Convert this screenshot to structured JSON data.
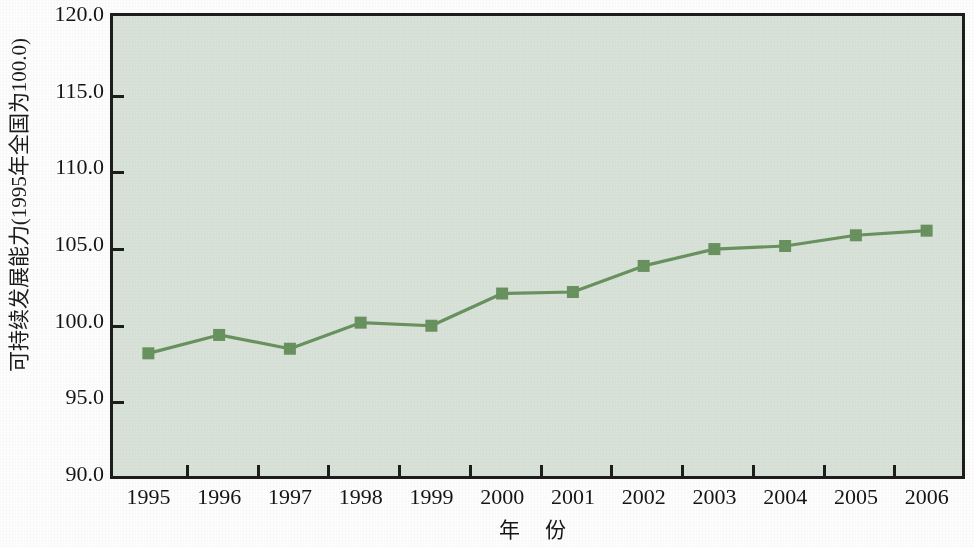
{
  "chart_data": {
    "type": "line",
    "title": "",
    "subtitle": "",
    "xlabel": "年  份",
    "ylabel": "可持续发展能力(1995年全国为100.0)",
    "categories": [
      "1995",
      "1996",
      "1997",
      "1998",
      "1999",
      "2000",
      "2001",
      "2002",
      "2003",
      "2004",
      "2005",
      "2006"
    ],
    "values": [
      98.0,
      99.2,
      98.3,
      100.0,
      99.8,
      101.9,
      102.0,
      103.7,
      104.8,
      105.0,
      105.7,
      106.0
    ],
    "series": [
      {
        "name": "可持续发展能力",
        "values": [
          98.0,
          99.2,
          98.3,
          100.0,
          99.8,
          101.9,
          102.0,
          103.7,
          104.8,
          105.0,
          105.7,
          106.0
        ]
      }
    ],
    "ylim": [
      90.0,
      120.0
    ],
    "yticks": [
      90.0,
      95.0,
      100.0,
      105.0,
      110.0,
      115.0,
      120.0
    ],
    "ytick_labels": [
      "90.0",
      "95.0",
      "100.0",
      "105.0",
      "110.0",
      "115.0",
      "120.0"
    ],
    "xtick_labels": [
      "1995",
      "1996",
      "1997",
      "1998",
      "1999",
      "2000",
      "2001",
      "2002",
      "2003",
      "2004",
      "2005",
      "2006"
    ],
    "grid": false,
    "legend": false,
    "legend_position": "none",
    "marker": "square",
    "colors": {
      "line": "#68925f",
      "marker": "#68925f",
      "plot_background": "#d9e2d8",
      "frame": "#1d1d1b",
      "figure_background": "#fdfdfd",
      "text": "#141414"
    }
  },
  "axis": {
    "y_title": "可持续发展能力(1995年全国为100.0)",
    "x_title": "年  份"
  }
}
